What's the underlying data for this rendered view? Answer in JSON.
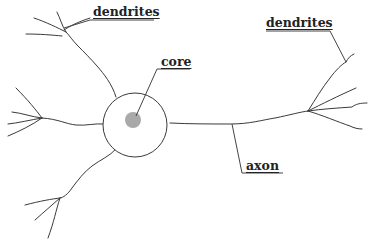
{
  "diagram": {
    "labels": {
      "dendrites_left": "dendrites",
      "dendrites_right": "dendrites",
      "core": "core",
      "axon": "axon"
    },
    "colors": {
      "line": "#3a3a3a",
      "cell_body_fill": "#ffffff",
      "core_fill": "#a9a9a9",
      "background": "#ffffff"
    },
    "parts": [
      "cell body",
      "core",
      "dendrites",
      "axon"
    ]
  }
}
